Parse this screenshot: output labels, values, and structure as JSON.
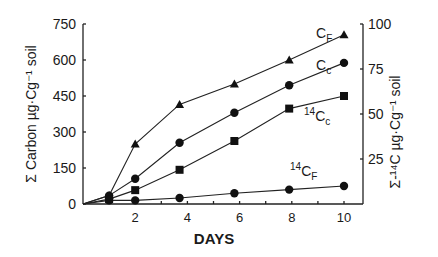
{
  "chart_data": {
    "type": "line",
    "title": "",
    "xlabel": "DAYS",
    "ylabel": "Σ Carbon µg·Cg⁻¹ soil",
    "ylabel_right": "Σ-¹⁴C µg·Cg⁻¹ soil",
    "xlim": [
      0,
      10.5
    ],
    "ylim": [
      0,
      750
    ],
    "ylim_right": [
      0,
      100
    ],
    "xticks": [
      2,
      4,
      6,
      8,
      10
    ],
    "xminor_ticks": [
      1,
      3,
      5,
      7,
      9
    ],
    "yticks": [
      0,
      150,
      300,
      450,
      600,
      750
    ],
    "yticks_right": [
      25,
      50,
      75,
      100
    ],
    "grid": false,
    "legend": "inline labels near series ends",
    "series": [
      {
        "name": "CF",
        "label_main": "C",
        "label_sub": "F",
        "label_sup": "",
        "marker": "triangle",
        "axis": "left",
        "x": [
          0,
          1,
          2,
          3.7,
          5.8,
          7.9,
          10
        ],
        "y": [
          0,
          35,
          250,
          415,
          500,
          600,
          705
        ]
      },
      {
        "name": "Cc",
        "label_main": "C",
        "label_sub": "c",
        "label_sup": "",
        "marker": "circle",
        "axis": "left",
        "x": [
          0,
          1,
          2,
          3.7,
          5.8,
          7.9,
          10
        ],
        "y": [
          0,
          35,
          105,
          255,
          380,
          495,
          588
        ]
      },
      {
        "name": "14Cc",
        "label_main": "C",
        "label_sub": "c",
        "label_sup": "14",
        "marker": "square",
        "axis": "right",
        "x": [
          0,
          1,
          2,
          3.7,
          5.8,
          7.9,
          10
        ],
        "y": [
          0,
          2.7,
          7.7,
          19,
          35,
          53,
          60
        ]
      },
      {
        "name": "14CF",
        "label_main": "C",
        "label_sub": "F",
        "label_sup": "14",
        "marker": "circle",
        "axis": "right",
        "x": [
          0,
          1,
          2,
          3.7,
          5.8,
          7.9,
          10
        ],
        "y": [
          0,
          2,
          2,
          3.3,
          6,
          8,
          10
        ]
      }
    ]
  }
}
